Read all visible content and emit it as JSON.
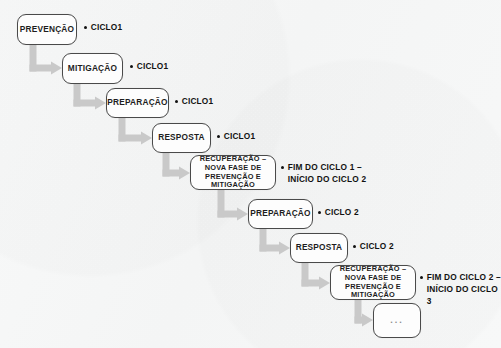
{
  "diagram": {
    "background_color": "#f6f7f7",
    "arrow_color": "#c9c9c9",
    "box_border_color": "#4a4a4a",
    "box_fill_color": "#fdfdfd",
    "text_color": "#1d1d1d",
    "nodes": [
      {
        "id": "prevencao-1",
        "label": "PREVENÇÃO",
        "x": 17,
        "y": 14,
        "w": 60,
        "h": 31,
        "style": "single"
      },
      {
        "id": "mitigacao-1",
        "label": "MITIGAÇÃO",
        "x": 62,
        "y": 53,
        "w": 61,
        "h": 31,
        "style": "single"
      },
      {
        "id": "preparacao-1",
        "label": "PREPARAÇÃO",
        "x": 106,
        "y": 88,
        "w": 63,
        "h": 30,
        "style": "single"
      },
      {
        "id": "resposta-1",
        "label": "RESPOSTA",
        "x": 152,
        "y": 123,
        "w": 59,
        "h": 30,
        "style": "single"
      },
      {
        "id": "recuperacao-1",
        "label": "RECUPERAÇÃO – NOVA FASE DE PREVENÇÃO E MITIGAÇÃO",
        "x": 190,
        "y": 155,
        "w": 86,
        "h": 35,
        "style": "multi"
      },
      {
        "id": "preparacao-2",
        "label": "PREPARAÇÃO",
        "x": 248,
        "y": 199,
        "w": 65,
        "h": 30,
        "style": "single"
      },
      {
        "id": "resposta-2",
        "label": "RESPOSTA",
        "x": 290,
        "y": 233,
        "w": 58,
        "h": 30,
        "style": "single"
      },
      {
        "id": "recuperacao-2",
        "label": "RECUPERAÇÃO – NOVA FASE DE PREVENÇÃO E MITIGAÇÃO",
        "x": 330,
        "y": 265,
        "w": 86,
        "h": 35,
        "style": "multi"
      },
      {
        "id": "continuacao",
        "label": "...",
        "x": 373,
        "y": 303,
        "w": 48,
        "h": 35,
        "style": "dots"
      }
    ],
    "annotations": [
      {
        "id": "note-prevencao-1",
        "text": "CICLO1",
        "x": 84,
        "y": 22,
        "lines": 1
      },
      {
        "id": "note-mitigacao-1",
        "text": "CICLO1",
        "x": 130,
        "y": 61,
        "lines": 1
      },
      {
        "id": "note-preparacao-1",
        "text": "CICLO1",
        "x": 175,
        "y": 96,
        "lines": 1
      },
      {
        "id": "note-resposta-1",
        "text": "CICLO1",
        "x": 217,
        "y": 131,
        "lines": 1
      },
      {
        "id": "note-recuperacao-1",
        "text": "FIM DO CICLO 1 –\nINÍCIO DO CICLO 2",
        "x": 281,
        "y": 162,
        "lines": 2
      },
      {
        "id": "note-preparacao-2",
        "text": "CICLO 2",
        "x": 318,
        "y": 207,
        "lines": 1
      },
      {
        "id": "note-resposta-2",
        "text": "CICLO 2",
        "x": 353,
        "y": 241,
        "lines": 1
      },
      {
        "id": "note-recuperacao-2",
        "text": "FIM DO CICLO 2 –\nINÍCIO DO CICLO 3",
        "x": 420,
        "y": 272,
        "lines": 2
      }
    ],
    "connectors": [
      {
        "id": "arrow-prevencao-to-mitigacao",
        "from": "prevencao-1",
        "to": "mitigacao-1",
        "sx": 33,
        "sy": 45,
        "cy": 68,
        "ex": 62
      },
      {
        "id": "arrow-mitigacao-to-preparacao",
        "from": "mitigacao-1",
        "to": "preparacao-1",
        "sx": 77,
        "sy": 84,
        "cy": 103,
        "ex": 106
      },
      {
        "id": "arrow-preparacao-to-resposta",
        "from": "preparacao-1",
        "to": "resposta-1",
        "sx": 122,
        "sy": 118,
        "cy": 138,
        "ex": 152
      },
      {
        "id": "arrow-resposta-to-recuperacao",
        "from": "resposta-1",
        "to": "recuperacao-1",
        "sx": 166,
        "sy": 153,
        "cy": 173,
        "ex": 190
      },
      {
        "id": "arrow-recuperacao-to-preparacao2",
        "from": "recuperacao-1",
        "to": "preparacao-2",
        "sx": 221,
        "sy": 190,
        "cy": 214,
        "ex": 248
      },
      {
        "id": "arrow-preparacao2-to-resposta2",
        "from": "preparacao-2",
        "to": "resposta-2",
        "sx": 263,
        "sy": 229,
        "cy": 248,
        "ex": 290
      },
      {
        "id": "arrow-resposta2-to-recuperacao2",
        "from": "resposta-2",
        "to": "recuperacao-2",
        "sx": 305,
        "sy": 263,
        "cy": 283,
        "ex": 330
      },
      {
        "id": "arrow-recuperacao2-to-continuacao",
        "from": "recuperacao-2",
        "to": "continuacao",
        "sx": 358,
        "sy": 300,
        "cy": 320,
        "ex": 373
      }
    ]
  }
}
